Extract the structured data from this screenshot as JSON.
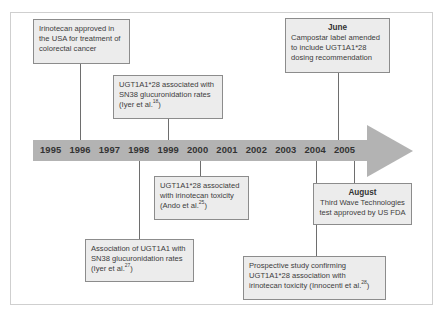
{
  "diagram": {
    "type": "timeline",
    "colors": {
      "arrow": "#b3b3b3",
      "box_fill": "#ececec",
      "box_border": "#8c8c8c",
      "connector": "#6e6e6e",
      "frame": "#cfcfcf"
    },
    "years": [
      "1995",
      "1996",
      "1997",
      "1998",
      "1999",
      "2000",
      "2001",
      "2002",
      "2003",
      "2004",
      "2005"
    ],
    "events_above": [
      {
        "year": "1996",
        "heading": "",
        "text": "Irinotecan approved in the USA for treatment of colorectal cancer",
        "ref": ""
      },
      {
        "year": "1999",
        "heading": "",
        "text": "UGT1A1*28 associated with SN38 glucuronidation rates (Iyer et al.",
        "ref": "18",
        "suffix": ")"
      },
      {
        "year": "2005",
        "heading": "June",
        "text": "Campostar label amended to include UGT1A1*28 dosing recommendation",
        "ref": ""
      }
    ],
    "events_below": [
      {
        "year": "2000",
        "heading": "",
        "text": "UGT1A1*28 associated with irinotecan toxicity (Ando et al.",
        "ref": "25",
        "suffix": ")"
      },
      {
        "year": "2005",
        "heading": "August",
        "text": "Third Wave Technologies test approved by US FDA",
        "ref": ""
      },
      {
        "year": "1998",
        "heading": "",
        "text": "Association of UGT1A1 with SN38 glucuronidation rates (Iyer et al.",
        "ref": "27",
        "suffix": ")"
      },
      {
        "year": "2004",
        "heading": "",
        "text": "Prospective study confirming UGT1A1*28 association with irinotecan toxicity (Innocenti et al.",
        "ref": "28",
        "suffix": ")"
      }
    ]
  }
}
